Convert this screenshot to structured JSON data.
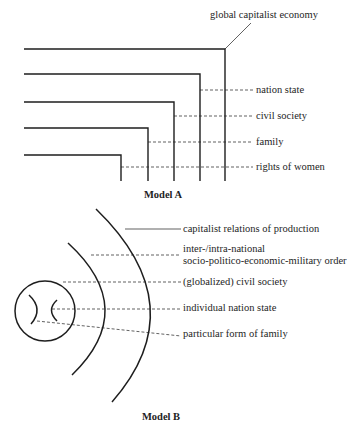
{
  "model_a": {
    "caption": "Model A",
    "labels": {
      "global": "global capitalist economy",
      "nation_state": "nation state",
      "civil_society": "civil society",
      "family": "family",
      "rights_of_women": "rights of women"
    }
  },
  "model_b": {
    "caption": "Model B",
    "labels": {
      "capitalist": "capitalist relations of production",
      "order_line1": "inter-/intra-national",
      "order_line2": "socio-politico-economic-military order",
      "civil_society": "(globalized) civil society",
      "nation_state": "individual nation state",
      "family": "particular form of family"
    }
  },
  "colors": {
    "ink": "#1e1e1e",
    "background": "#ffffff"
  }
}
